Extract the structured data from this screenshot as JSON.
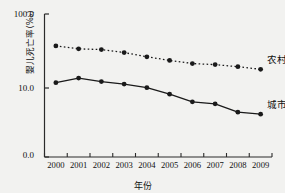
{
  "chart_data": {
    "type": "line",
    "title": "",
    "xlabel": "年份",
    "ylabel": "婴儿死亡率(‰)",
    "categories": [
      "2000",
      "2001",
      "2002",
      "2003",
      "2004",
      "2005",
      "2006",
      "2007",
      "2008",
      "2009"
    ],
    "yticks": [
      "0.0",
      "10.0",
      "100.0"
    ],
    "ytick_values": [
      0.0,
      10.0,
      100.0
    ],
    "ylim": [
      0.0,
      100.0
    ],
    "grid": false,
    "legend_position": "right-inline",
    "series": [
      {
        "name": "农村",
        "label": "农村",
        "style": "dotted",
        "marker": "filled-circle",
        "color": "#1a1a1a",
        "values": [
          37.0,
          33.8,
          33.1,
          30.1,
          26.4,
          23.6,
          21.4,
          20.7,
          19.4,
          17.9
        ]
      },
      {
        "name": "城市",
        "label": "城市",
        "style": "solid",
        "marker": "filled-circle",
        "color": "#1a1a1a",
        "values": [
          11.8,
          13.6,
          12.2,
          11.3,
          10.1,
          9.1,
          8.0,
          7.7,
          6.5,
          6.2
        ]
      }
    ]
  },
  "axes": {
    "y_title": "婴儿死亡率(‰)",
    "x_title": "年份",
    "y_labels": [
      "100.0",
      "10.0",
      "0.0"
    ],
    "x_labels": [
      "2000",
      "2001",
      "2002",
      "2003",
      "2004",
      "2005",
      "2006",
      "2007",
      "2008",
      "2009"
    ]
  },
  "labels": {
    "rural": "农村",
    "urban": "城市"
  }
}
